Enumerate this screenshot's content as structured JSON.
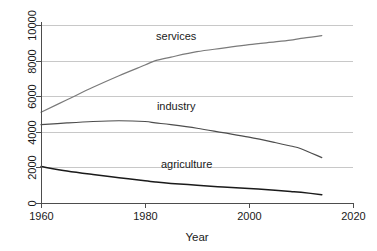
{
  "chart_data": {
    "type": "line",
    "title": "",
    "xlabel": "Year",
    "ylabel": "",
    "xlim": [
      1960,
      2020
    ],
    "ylim": [
      0,
      10000
    ],
    "grid": true,
    "legend": "inline-labels",
    "xticks": [
      1960,
      1980,
      2000,
      2020
    ],
    "yticks": [
      0,
      2000,
      4000,
      6000,
      8000,
      10000
    ],
    "xtick_labels": [
      "1960",
      "1980",
      "2000",
      "2020"
    ],
    "ytick_labels": [
      "0",
      "2000",
      "4000",
      "6000",
      "8000",
      "10000"
    ],
    "x": [
      1960,
      1965,
      1970,
      1975,
      1980,
      1982,
      1985,
      1990,
      1995,
      2000,
      2005,
      2008,
      2010,
      2014
    ],
    "series": [
      {
        "name": "services",
        "label": "services",
        "color": "#7a7a7a",
        "values": [
          5100,
          5800,
          6500,
          7150,
          7750,
          8000,
          8200,
          8500,
          8700,
          8900,
          9050,
          9150,
          9250,
          9400
        ]
      },
      {
        "name": "industry",
        "label": "industry",
        "color": "#4d4d4d",
        "values": [
          4400,
          4500,
          4580,
          4620,
          4580,
          4500,
          4400,
          4200,
          3950,
          3700,
          3400,
          3200,
          3050,
          2550
        ]
      },
      {
        "name": "agriculture",
        "label": "agriculture",
        "color": "#1a1a1a",
        "values": [
          2050,
          1800,
          1600,
          1420,
          1250,
          1180,
          1100,
          1000,
          900,
          820,
          720,
          650,
          600,
          470
        ]
      }
    ],
    "annotations": [
      {
        "text": "services",
        "x": 1986,
        "y": 9150
      },
      {
        "text": "industry",
        "x": 1986,
        "y": 5200
      },
      {
        "text": "agriculture",
        "x": 1988,
        "y": 1950
      }
    ]
  }
}
